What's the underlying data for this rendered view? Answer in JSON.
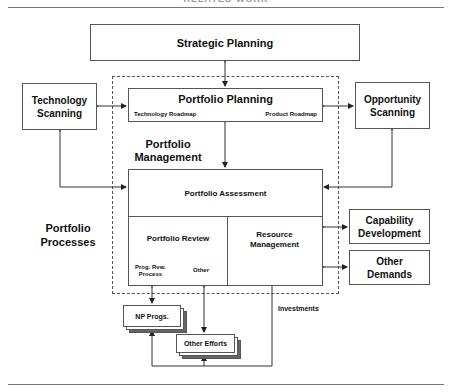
{
  "header": {
    "title": "RELATED WORK"
  },
  "boxes": {
    "strategic_planning": "Strategic Planning",
    "technology_scanning": [
      "Technology",
      "Scanning"
    ],
    "opportunity_scanning": [
      "Opportunity",
      "Scanning"
    ],
    "portfolio_planning": "Portfolio Planning",
    "technology_roadmap": "Technology Roadmap",
    "product_roadmap": "Product Roadmap",
    "portfolio_assessment": "Portfolio Assessment",
    "portfolio_review": "Portfolio Review",
    "prog_rvw_process": [
      "Prog. Rvw.",
      "Process"
    ],
    "other": "Other",
    "resource_management": [
      "Resource",
      "Management"
    ],
    "capability_development": [
      "Capability",
      "Development"
    ],
    "other_demands": [
      "Other",
      "Demands"
    ],
    "np_progs": "NP Progs.",
    "other_efforts": "Other Efforts"
  },
  "labels": {
    "portfolio_management": [
      "Portfolio",
      "Management"
    ],
    "portfolio_processes": [
      "Portfolio",
      "Processes"
    ],
    "investments": "Investments"
  },
  "colors": {
    "line": "#333333",
    "dash": "#555555",
    "shadow": "#666666"
  }
}
